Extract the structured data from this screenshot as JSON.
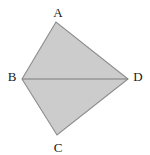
{
  "figure": {
    "background_color": "#ffffff",
    "fill_color": "#cccccc",
    "stroke_color": "#8c8c8c",
    "diagonal_color": "#7d7d7d",
    "label_color": "#1a1a1a",
    "canvas": {
      "width": 150,
      "height": 155
    },
    "vertices": [
      {
        "name": "A",
        "label": "A",
        "x": 56,
        "y": 22,
        "label_x": 58,
        "label_y": 12
      },
      {
        "name": "B",
        "label": "B",
        "x": 22,
        "y": 79,
        "label_x": 12,
        "label_y": 76
      },
      {
        "name": "C",
        "label": "C",
        "x": 57,
        "y": 135,
        "label_x": 58,
        "label_y": 147
      },
      {
        "name": "D",
        "label": "D",
        "x": 128,
        "y": 79,
        "label_x": 138,
        "label_y": 76
      }
    ],
    "edges": [
      {
        "name": "edge-ab",
        "from": "A",
        "to": "B"
      },
      {
        "name": "edge-bc",
        "from": "B",
        "to": "C"
      },
      {
        "name": "edge-cd",
        "from": "C",
        "to": "D"
      },
      {
        "name": "edge-da",
        "from": "D",
        "to": "A"
      }
    ],
    "diagonal": {
      "name": "diagonal-bd",
      "from": "B",
      "to": "D"
    },
    "polygon_points": "56,22 128,79 57,135 22,79"
  }
}
